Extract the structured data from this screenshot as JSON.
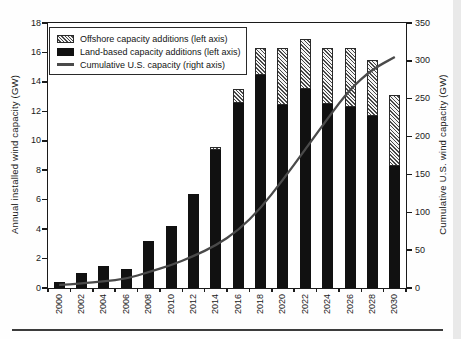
{
  "chart_data": {
    "type": "bar",
    "subtype": "stacked-bars-with-cumulative-line",
    "title": "",
    "categories": [
      "2000",
      "2002",
      "2004",
      "2006",
      "2008",
      "2010",
      "2012",
      "2014",
      "2016",
      "2018",
      "2020",
      "2022",
      "2024",
      "2026",
      "2028",
      "2030"
    ],
    "series": [
      {
        "name": "Offshore capacity additions (left axis)",
        "type": "bar",
        "axis": "left",
        "style": "hatched",
        "values": [
          0,
          0,
          0,
          0,
          0,
          0,
          0,
          0.2,
          0.9,
          1.8,
          3.9,
          3.4,
          3.8,
          4.0,
          3.8,
          4.8
        ]
      },
      {
        "name": "Land-based capacity additions (left axis)",
        "type": "bar",
        "axis": "left",
        "style": "solid-black",
        "values": [
          0.4,
          1.0,
          1.5,
          1.3,
          3.2,
          4.2,
          6.4,
          9.4,
          12.6,
          14.5,
          12.4,
          13.5,
          12.5,
          12.3,
          11.7,
          8.3
        ]
      },
      {
        "name": "Cumulative U.S. capacity (right axis)",
        "type": "line",
        "axis": "right",
        "values": [
          4,
          6,
          9,
          12,
          21,
          30,
          42,
          56,
          76,
          105,
          143,
          183,
          224,
          263,
          289,
          305
        ]
      }
    ],
    "left_axis": {
      "label": "Annual installed wind capacity (GW)",
      "min": 0,
      "max": 18,
      "step": 2,
      "ticks": [
        "0",
        "2",
        "4",
        "6",
        "8",
        "10",
        "12",
        "14",
        "16",
        "18"
      ]
    },
    "right_axis": {
      "label": "Cumulative U.S. wind capacity (GW)",
      "min": 0,
      "max": 350,
      "step": 50,
      "ticks": [
        "0",
        "50",
        "100",
        "150",
        "200",
        "250",
        "300",
        "350"
      ]
    },
    "x_axis": {
      "label": "",
      "tick_labels_rotated_90": true
    },
    "legend": {
      "position": "top-left-inside"
    },
    "grid": "off",
    "colors": {
      "bar": "#111111",
      "line": "#4a4a4a",
      "hatch_line": "#474747",
      "hatch_bg": "#f4f4f4",
      "frame": "#1a1a1a"
    }
  }
}
